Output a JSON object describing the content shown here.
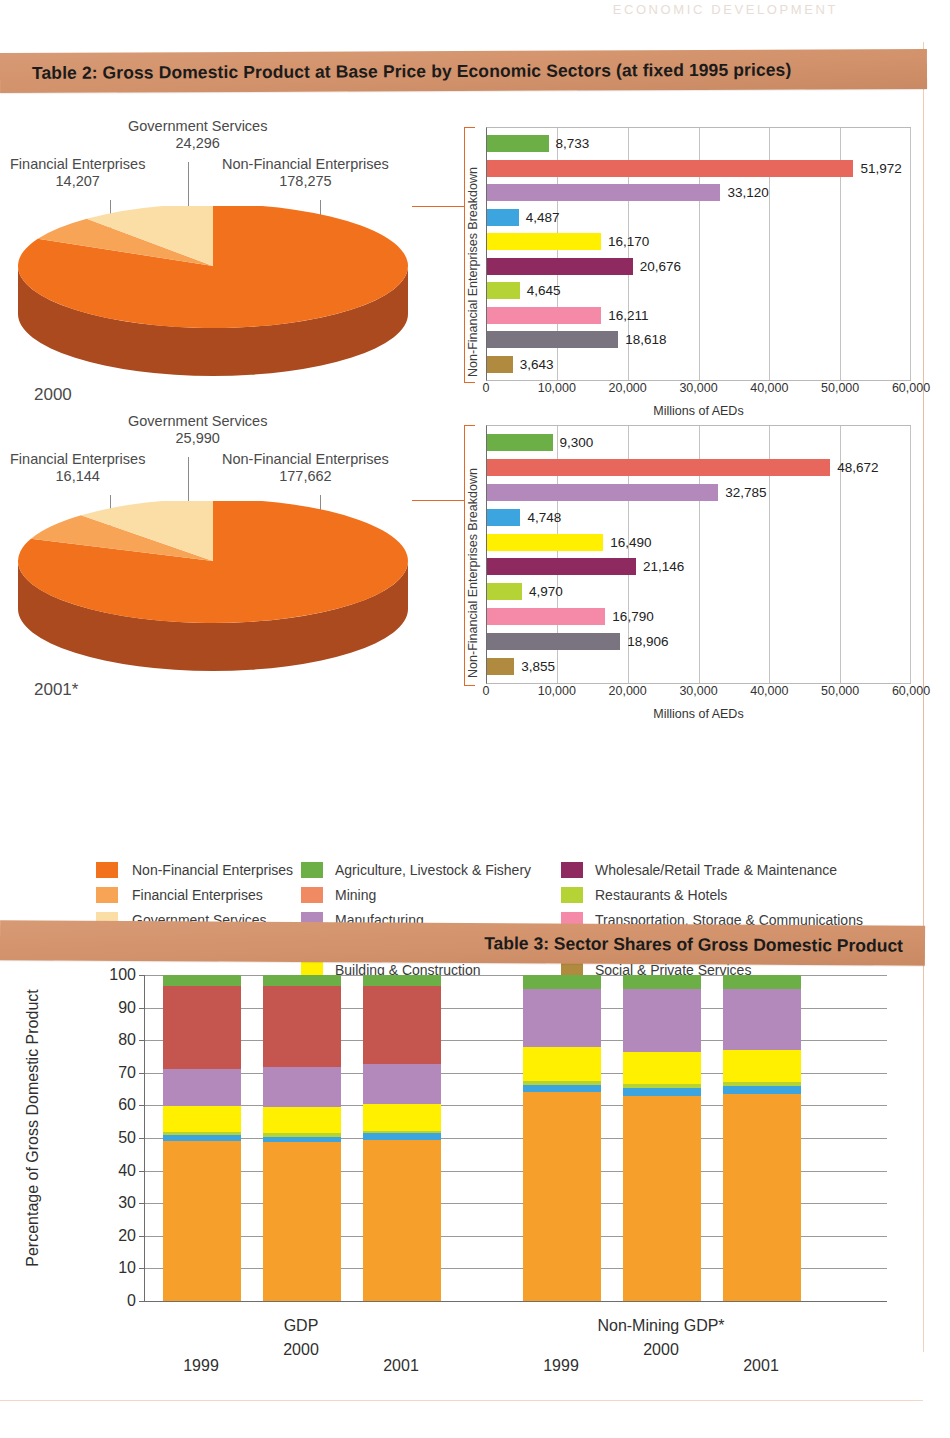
{
  "running_head": "ECONOMIC DEVELOPMENT",
  "table2": {
    "banner_title": "Table 2:  Gross Domestic Product at Base Price by Economic Sectors (at fixed 1995 prices)",
    "pies": [
      {
        "year_label": "2000",
        "slices": [
          {
            "name": "Non-Financial Enterprises",
            "value": "178,275",
            "num": 178275,
            "color": "#F2711C"
          },
          {
            "name": "Financial Enterprises",
            "value": "14,207",
            "num": 14207,
            "color": "#F8A456"
          },
          {
            "name": "Government Services",
            "value": "24,296",
            "num": 24296,
            "color": "#FBDDA6"
          }
        ]
      },
      {
        "year_label": "2001*",
        "slices": [
          {
            "name": "Non-Financial Enterprises",
            "value": "177,662",
            "num": 177662,
            "color": "#F2711C"
          },
          {
            "name": "Financial Enterprises",
            "value": "16,144",
            "num": 16144,
            "color": "#F8A456"
          },
          {
            "name": "Government Services",
            "value": "25,990",
            "num": 25990,
            "color": "#FBDDA6"
          }
        ]
      }
    ],
    "bar_charts": [
      {
        "for_year": "2000",
        "y_axis_title": "Non-Financial Enterprises Breakdown",
        "x_axis_title": "Millions of AEDs",
        "x_ticks": [
          "0",
          "10,000",
          "20,000",
          "30,000",
          "40,000",
          "50,000",
          "60,000"
        ],
        "x_max": 60000,
        "bars": [
          {
            "sector": "Agriculture, Livestock & Fishery",
            "label": "8,733",
            "value": 8733,
            "color": "#6DAF47"
          },
          {
            "sector": "Mining",
            "label": "51,972",
            "value": 51972,
            "color": "#E8675C"
          },
          {
            "sector": "Manufacturing",
            "label": "33,120",
            "value": 33120,
            "color": "#B389BC"
          },
          {
            "sector": "Electricity, Gas & Water",
            "label": "4,487",
            "value": 4487,
            "color": "#3CA5E0"
          },
          {
            "sector": "Building & Construction",
            "label": "16,170",
            "value": 16170,
            "color": "#FFF000"
          },
          {
            "sector": "Wholesale/Retail Trade & Maintenance",
            "label": "20,676",
            "value": 20676,
            "color": "#8E2A60"
          },
          {
            "sector": "Restaurants & Hotels",
            "label": "4,645",
            "value": 4645,
            "color": "#B5D334"
          },
          {
            "sector": "Transportation, Storage & Communications",
            "label": "16,211",
            "value": 16211,
            "color": "#F489A8"
          },
          {
            "sector": "Real Estate & Business Services",
            "label": "18,618",
            "value": 18618,
            "color": "#7A7480"
          },
          {
            "sector": "Social & Private Services",
            "label": "3,643",
            "value": 3643,
            "color": "#B08A3E"
          }
        ]
      },
      {
        "for_year": "2001*",
        "y_axis_title": "Non-Financial Enterprises Breakdown",
        "x_axis_title": "Millions of AEDs",
        "x_ticks": [
          "0",
          "10,000",
          "20,000",
          "30,000",
          "40,000",
          "50,000",
          "60,000"
        ],
        "x_max": 60000,
        "bars": [
          {
            "sector": "Agriculture, Livestock & Fishery",
            "label": "9,300",
            "value": 9300,
            "color": "#6DAF47"
          },
          {
            "sector": "Mining",
            "label": "48,672",
            "value": 48672,
            "color": "#E8675C"
          },
          {
            "sector": "Manufacturing",
            "label": "32,785",
            "value": 32785,
            "color": "#B389BC"
          },
          {
            "sector": "Electricity, Gas & Water",
            "label": "4,748",
            "value": 4748,
            "color": "#3CA5E0"
          },
          {
            "sector": "Building & Construction",
            "label": "16,490",
            "value": 16490,
            "color": "#FFF000"
          },
          {
            "sector": "Wholesale/Retail Trade & Maintenance",
            "label": "21,146",
            "value": 21146,
            "color": "#8E2A60"
          },
          {
            "sector": "Restaurants & Hotels",
            "label": "4,970",
            "value": 4970,
            "color": "#B5D334"
          },
          {
            "sector": "Transportation, Storage & Communications",
            "label": "16,790",
            "value": 16790,
            "color": "#F489A8"
          },
          {
            "sector": "Real Estate & Business Services",
            "label": "18,906",
            "value": 18906,
            "color": "#7A7480"
          },
          {
            "sector": "Social & Private Services",
            "label": "3,855",
            "value": 3855,
            "color": "#B08A3E"
          }
        ]
      }
    ],
    "legend": {
      "col1": [
        {
          "label": "Non-Financial Enterprises",
          "color": "#F2711C"
        },
        {
          "label": "Financial Enterprises",
          "color": "#F8A456"
        },
        {
          "label": "Government Services",
          "color": "#FBDDA6"
        }
      ],
      "col2": [
        {
          "label": "Agriculture, Livestock & Fishery",
          "color": "#6DAF47"
        },
        {
          "label": "Mining",
          "color": "#F08A62"
        },
        {
          "label": "Manufacturing",
          "color": "#B389BC"
        },
        {
          "label": "Electricity, Gas & Water",
          "color": "#3CA5E0"
        },
        {
          "label": "Building & Construction",
          "color": "#FFF000"
        }
      ],
      "col3": [
        {
          "label": "Wholesale/Retail Trade & Maintenance",
          "color": "#8E2A60"
        },
        {
          "label": "Restaurants & Hotels",
          "color": "#B5D334"
        },
        {
          "label": "Transportation, Storage & Communications",
          "color": "#F489A8"
        },
        {
          "label": "Real Estate & Business Services",
          "color": "#7A7480"
        },
        {
          "label": "Social & Private Services",
          "color": "#B08A3E"
        }
      ]
    }
  },
  "table3": {
    "banner_title": "Table 3: Sector Shares of Gross Domestic Product"
  },
  "chart_data": [
    {
      "type": "pie",
      "title": "2000",
      "labels": [
        "Non-Financial Enterprises",
        "Financial Enterprises",
        "Government Services"
      ],
      "values": [
        178275,
        14207,
        24296
      ],
      "colors": [
        "#F2711C",
        "#F8A456",
        "#FBDDA6"
      ],
      "units": "Millions of AEDs",
      "legend": "callout-labels"
    },
    {
      "type": "pie",
      "title": "2001*",
      "labels": [
        "Non-Financial Enterprises",
        "Financial Enterprises",
        "Government Services"
      ],
      "values": [
        177662,
        16144,
        25990
      ],
      "colors": [
        "#F2711C",
        "#F8A456",
        "#FBDDA6"
      ],
      "units": "Millions of AEDs",
      "legend": "callout-labels"
    },
    {
      "type": "bar",
      "orientation": "horizontal",
      "title": "Non-Financial Enterprises Breakdown 2000",
      "xlabel": "Millions of AEDs",
      "ylabel": "Non-Financial Enterprises Breakdown",
      "xlim": [
        0,
        60000
      ],
      "xticks": [
        0,
        10000,
        20000,
        30000,
        40000,
        50000,
        60000
      ],
      "grid": true,
      "categories": [
        "Agriculture, Livestock & Fishery",
        "Mining",
        "Manufacturing",
        "Electricity, Gas & Water",
        "Building & Construction",
        "Wholesale/Retail Trade & Maintenance",
        "Restaurants & Hotels",
        "Transportation, Storage & Communications",
        "Real Estate & Business Services",
        "Social & Private Services"
      ],
      "values": [
        8733,
        51972,
        33120,
        4487,
        16170,
        20676,
        4645,
        16211,
        18618,
        3643
      ]
    },
    {
      "type": "bar",
      "orientation": "horizontal",
      "title": "Non-Financial Enterprises Breakdown 2001*",
      "xlabel": "Millions of AEDs",
      "ylabel": "Non-Financial Enterprises Breakdown",
      "xlim": [
        0,
        60000
      ],
      "xticks": [
        0,
        10000,
        20000,
        30000,
        40000,
        50000,
        60000
      ],
      "grid": true,
      "categories": [
        "Agriculture, Livestock & Fishery",
        "Mining",
        "Manufacturing",
        "Electricity, Gas & Water",
        "Building & Construction",
        "Wholesale/Retail Trade & Maintenance",
        "Restaurants & Hotels",
        "Transportation, Storage & Communications",
        "Real Estate & Business Services",
        "Social & Private Services"
      ],
      "values": [
        9300,
        48672,
        32785,
        4748,
        16490,
        21146,
        4970,
        16790,
        18906,
        3855
      ]
    },
    {
      "type": "bar",
      "stacked": true,
      "title": "Table 3: Sector Shares of Gross Domestic Product",
      "ylabel": "Percentage of Gross Domestic Product",
      "ylim": [
        0,
        100
      ],
      "yticks": [
        0,
        10,
        20,
        30,
        40,
        50,
        60,
        70,
        80,
        90,
        100
      ],
      "grid": true,
      "groups": [
        {
          "name": "GDP",
          "categories": [
            "1999",
            "2000",
            "2001"
          ]
        },
        {
          "name": "Non-Mining GDP*",
          "categories": [
            "1999",
            "2000",
            "2001"
          ]
        }
      ],
      "categories": [
        "1999",
        "2000",
        "2001",
        "1999",
        "2000",
        "2001"
      ],
      "series": [
        {
          "name": "Non-Financial/Other (orange)",
          "color": "#F6A02B",
          "values": [
            49.2,
            48.7,
            49.5,
            65.0,
            63.7,
            65.2
          ]
        },
        {
          "name": "Electricity, Gas & Water",
          "color": "#3CA5E0",
          "values": [
            1.6,
            1.7,
            1.9,
            2.2,
            2.4,
            2.4
          ]
        },
        {
          "name": "Restaurants & Hotels",
          "color": "#B5D334",
          "values": [
            0.9,
            1.0,
            0.9,
            1.2,
            1.2,
            1.2
          ]
        },
        {
          "name": "Building & Construction",
          "color": "#FFF000",
          "values": [
            8.2,
            8.0,
            8.0,
            10.6,
            10.0,
            10.0
          ]
        },
        {
          "name": "Manufacturing",
          "color": "#B389BC",
          "values": [
            11.3,
            12.5,
            12.5,
            18.2,
            19.5,
            19.3
          ]
        },
        {
          "name": "Mining",
          "color": "#C4564F",
          "values": [
            25.5,
            24.8,
            23.8,
            0.0,
            0.0,
            0.0
          ]
        },
        {
          "name": "Agriculture, Livestock & Fishery",
          "color": "#6DAF47",
          "values": [
            3.3,
            3.3,
            3.4,
            4.3,
            4.5,
            4.4
          ]
        }
      ]
    }
  ]
}
